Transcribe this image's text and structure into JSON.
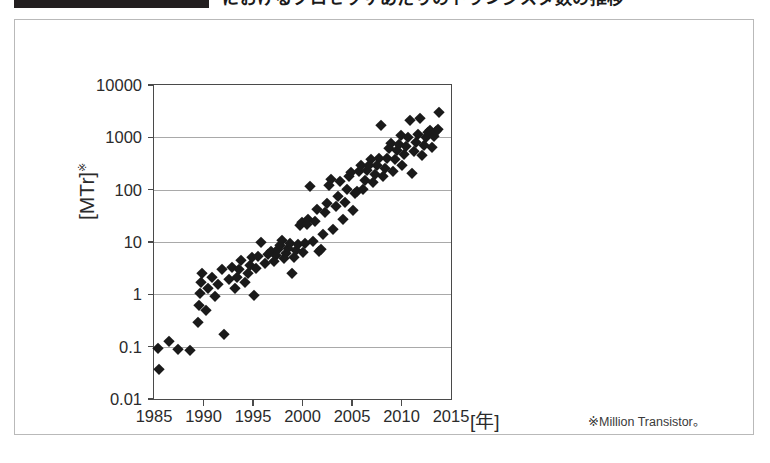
{
  "caption": {
    "badge_label": "",
    "title": "におけるプロセッサあたりのトランジスタ数の推移"
  },
  "chart_data": {
    "type": "scatter",
    "title": "",
    "xlabel": "[年]",
    "ylabel": "[MTr]",
    "ylabel_superscript": "※",
    "footnote": "※Million Transistor。",
    "xlim": [
      1985,
      2015
    ],
    "ylim": [
      0.01,
      10000
    ],
    "yscale": "log",
    "xticks": [
      1985,
      1990,
      1995,
      2000,
      2005,
      2010,
      2015
    ],
    "xtick_labels": [
      "1985",
      "1990",
      "1995",
      "2000",
      "2005",
      "2010",
      "2015"
    ],
    "yticks": [
      0.01,
      0.1,
      1,
      10,
      100,
      1000,
      10000
    ],
    "ytick_labels": [
      "0.01",
      "0.1",
      "1",
      "10",
      "100",
      "1000",
      "10000"
    ],
    "grid": "horizontal-major-only",
    "legend": null,
    "marker": "filled-diamond",
    "marker_color": "#1a1a1a",
    "points": [
      [
        1985.4,
        0.095
      ],
      [
        1985.5,
        0.037
      ],
      [
        1986.5,
        0.13
      ],
      [
        1987.4,
        0.09
      ],
      [
        1988.6,
        0.085
      ],
      [
        1989.4,
        0.3
      ],
      [
        1989.5,
        0.62
      ],
      [
        1989.6,
        1.05
      ],
      [
        1989.7,
        1.75
      ],
      [
        1989.8,
        2.6
      ],
      [
        1990.3,
        0.5
      ],
      [
        1990.5,
        1.3
      ],
      [
        1990.9,
        2.1
      ],
      [
        1991.2,
        0.93
      ],
      [
        1991.5,
        1.55
      ],
      [
        1991.9,
        3.05
      ],
      [
        1992.1,
        0.175
      ],
      [
        1992.6,
        1.95
      ],
      [
        1992.9,
        3.4
      ],
      [
        1993.2,
        1.35
      ],
      [
        1993.4,
        2.15
      ],
      [
        1993.6,
        3.1
      ],
      [
        1993.8,
        4.6
      ],
      [
        1994.2,
        1.7
      ],
      [
        1994.5,
        2.55
      ],
      [
        1994.7,
        3.6
      ],
      [
        1994.9,
        5.2
      ],
      [
        1995.1,
        0.95
      ],
      [
        1995.3,
        3.2
      ],
      [
        1995.5,
        5.4
      ],
      [
        1995.8,
        9.8
      ],
      [
        1996.2,
        3.9
      ],
      [
        1996.5,
        5.8
      ],
      [
        1996.8,
        6.8
      ],
      [
        1997.1,
        4.3
      ],
      [
        1997.3,
        5.6
      ],
      [
        1997.5,
        7.2
      ],
      [
        1997.7,
        8.9
      ],
      [
        1997.9,
        11.0
      ],
      [
        1998.1,
        4.9
      ],
      [
        1998.3,
        6.1
      ],
      [
        1998.5,
        7.6
      ],
      [
        1998.7,
        9.5
      ],
      [
        1998.9,
        2.6
      ],
      [
        1999.1,
        5.2
      ],
      [
        1999.3,
        6.9
      ],
      [
        1999.5,
        9.1
      ],
      [
        1999.7,
        21.0
      ],
      [
        1999.9,
        24.0
      ],
      [
        2000.1,
        6.4
      ],
      [
        2000.3,
        9.6
      ],
      [
        2000.5,
        22.0
      ],
      [
        2000.6,
        28.0
      ],
      [
        2000.8,
        118.0
      ],
      [
        2001.1,
        10.5
      ],
      [
        2001.3,
        25.0
      ],
      [
        2001.5,
        42.0
      ],
      [
        2001.7,
        6.8
      ],
      [
        2001.9,
        7.3
      ],
      [
        2002.1,
        14.0
      ],
      [
        2002.3,
        37.0
      ],
      [
        2002.5,
        55.0
      ],
      [
        2002.7,
        125.0
      ],
      [
        2002.9,
        160.0
      ],
      [
        2003.1,
        18.0
      ],
      [
        2003.4,
        48.0
      ],
      [
        2003.6,
        77.0
      ],
      [
        2003.8,
        145.0
      ],
      [
        2004.1,
        28.0
      ],
      [
        2004.3,
        58.0
      ],
      [
        2004.5,
        105.0
      ],
      [
        2004.7,
        180.0
      ],
      [
        2004.9,
        220.0
      ],
      [
        2005.1,
        40.0
      ],
      [
        2005.3,
        88.0
      ],
      [
        2005.5,
        95.0
      ],
      [
        2005.7,
        230.0
      ],
      [
        2005.9,
        290.0
      ],
      [
        2006.1,
        105.0
      ],
      [
        2006.3,
        155.0
      ],
      [
        2006.5,
        240.0
      ],
      [
        2006.7,
        300.0
      ],
      [
        2006.9,
        390.0
      ],
      [
        2007.1,
        140.0
      ],
      [
        2007.3,
        195.0
      ],
      [
        2007.5,
        290.0
      ],
      [
        2007.7,
        410.0
      ],
      [
        2007.9,
        1700.0
      ],
      [
        2008.1,
        180.0
      ],
      [
        2008.3,
        265.0
      ],
      [
        2008.5,
        410.0
      ],
      [
        2008.7,
        620.0
      ],
      [
        2008.9,
        790.0
      ],
      [
        2009.1,
        230.0
      ],
      [
        2009.3,
        380.0
      ],
      [
        2009.5,
        580.0
      ],
      [
        2009.7,
        760.0
      ],
      [
        2009.9,
        1100.0
      ],
      [
        2010.1,
        290.0
      ],
      [
        2010.3,
        470.0
      ],
      [
        2010.5,
        680.0
      ],
      [
        2010.7,
        995.0
      ],
      [
        2010.9,
        2100.0
      ],
      [
        2011.1,
        210.0
      ],
      [
        2011.3,
        560.0
      ],
      [
        2011.5,
        810.0
      ],
      [
        2011.7,
        1150.0
      ],
      [
        2011.9,
        2300.0
      ],
      [
        2012.1,
        450.0
      ],
      [
        2012.3,
        720.0
      ],
      [
        2012.5,
        995.0
      ],
      [
        2012.7,
        1250.0
      ],
      [
        2012.9,
        1400.0
      ],
      [
        2013.1,
        640.0
      ],
      [
        2013.3,
        1050.0
      ],
      [
        2013.5,
        1300.0
      ],
      [
        2013.7,
        1450.0
      ],
      [
        2013.8,
        3100.0
      ]
    ]
  }
}
